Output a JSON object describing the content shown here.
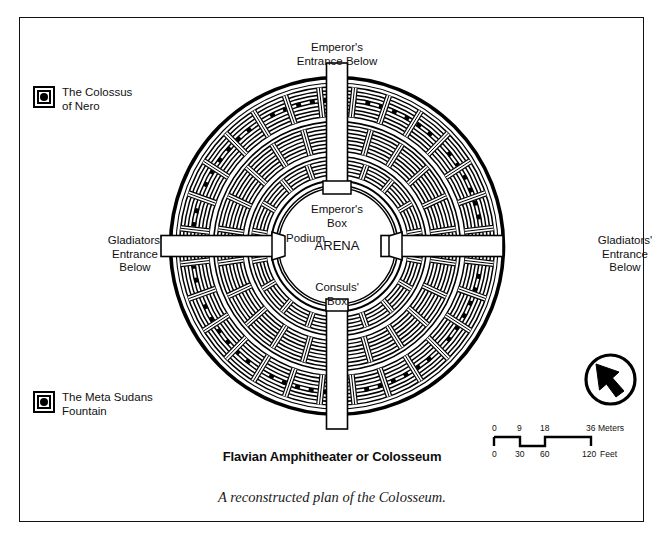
{
  "figure": {
    "title": "Flavian Amphitheater or Colosseum",
    "caption": "A reconstructed plan of the Colosseum."
  },
  "legend": {
    "items": [
      {
        "id": "colossus-of-nero",
        "label": "The Colossus\nof Nero",
        "marker": "concentric-square-dot-symbol"
      },
      {
        "id": "meta-sudans-fountain",
        "label": "The Meta Sudans\nFountain",
        "marker": "concentric-square-dot-symbol"
      }
    ]
  },
  "map": {
    "labels": {
      "emperors_entrance": "Emperor's\nEntrance Below",
      "gladiators_entrance_left": "Gladiators'\nEntrance\nBelow",
      "gladiators_entrance_right": "Gladiators'\nEntrance\nBelow",
      "emperors_box": "Emperor's\nBox",
      "consuls_box": "Consuls'\nBox",
      "podium": "Podium",
      "arena": "ARENA"
    },
    "colors": {
      "ink": "#000000",
      "paper": "#ffffff"
    }
  },
  "scalebar": {
    "meters": {
      "ticks": [
        "0",
        "9",
        "18",
        "36"
      ],
      "unit": "Meters"
    },
    "feet": {
      "ticks": [
        "0",
        "30",
        "60",
        "120"
      ],
      "unit": "Feet"
    }
  },
  "compass": {
    "name": "north-arrow"
  }
}
